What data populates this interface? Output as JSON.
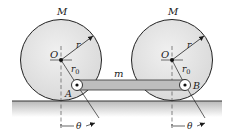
{
  "diagram": {
    "colors": {
      "disk_fill": "#e4e4e4",
      "disk_stroke": "#222222",
      "bar_fill": "#bdbdbd",
      "ground_line": "#333333",
      "ground_shade_top": "#b8b8b8",
      "ground_shade_bottom": "#ffffff",
      "ink": "#1a1a1a"
    },
    "labels": {
      "mass_left": "M",
      "mass_right": "M",
      "center_left": "O",
      "center_right": "O",
      "radius_left": "r",
      "radius_right": "r",
      "offset_left": "r",
      "offset_left_sub": "0",
      "offset_right": "r",
      "offset_right_sub": "0",
      "bar_mass": "m",
      "pin_left": "A",
      "pin_right": "B",
      "angle_left": "θ",
      "angle_right": "θ"
    },
    "components": [
      {
        "id": "disk-left",
        "type": "disk",
        "mass": "M",
        "radius": "r"
      },
      {
        "id": "disk-right",
        "type": "disk",
        "mass": "M",
        "radius": "r"
      },
      {
        "id": "bar",
        "type": "connecting-bar",
        "mass": "m",
        "ends": [
          "A",
          "B"
        ]
      },
      {
        "id": "ground",
        "type": "horizontal-surface"
      }
    ]
  }
}
